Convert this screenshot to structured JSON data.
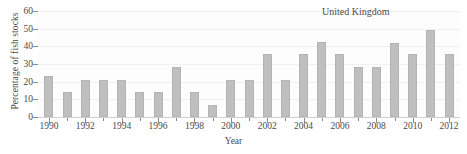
{
  "chart_data": {
    "type": "bar",
    "title": "",
    "annotation": "United Kingdom",
    "xlabel": "Year",
    "ylabel": "Percentage of fish stocks",
    "categories": [
      1990,
      1991,
      1992,
      1993,
      1994,
      1995,
      1996,
      1997,
      1998,
      1999,
      2000,
      2001,
      2002,
      2003,
      2004,
      2005,
      2006,
      2007,
      2008,
      2009,
      2010,
      2011,
      2012
    ],
    "values": [
      23,
      14,
      21,
      21,
      21,
      14,
      14,
      28.5,
      14,
      7,
      21,
      21,
      35.5,
      21,
      35.5,
      42.5,
      35.5,
      28.5,
      28.5,
      42,
      35.5,
      49,
      35.5
    ],
    "ylim": [
      0,
      60
    ],
    "yticks": [
      0,
      10,
      20,
      30,
      40,
      50,
      60
    ],
    "ytick_labels": [
      "0",
      "10",
      "20",
      "30",
      "40",
      "50",
      "60"
    ],
    "xlim": [
      1989.4,
      2012.6
    ],
    "xticks_major": [
      1990,
      1992,
      1994,
      1996,
      1998,
      2000,
      2002,
      2004,
      2006,
      2008,
      2010,
      2012
    ],
    "xtick_labels": [
      "1990",
      "1992",
      "1994",
      "1996",
      "1998",
      "2000",
      "2002",
      "2004",
      "2006",
      "2008",
      "2010",
      "2012"
    ],
    "xticks_minor": [
      1991,
      1993,
      1995,
      1997,
      1999,
      2001,
      2003,
      2005,
      2007,
      2009,
      2011
    ],
    "grid": true,
    "legend": "none",
    "bar_color": "#bfbfbf",
    "axis_color": "#8a8a8a",
    "grid_color": "#f0f0f0",
    "text_color": "#4a4a4a",
    "background_color": "#fdfdfd"
  }
}
